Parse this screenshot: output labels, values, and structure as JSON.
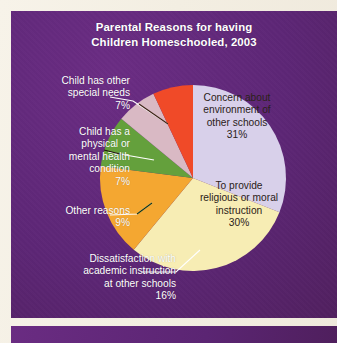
{
  "figure": {
    "title_line1": "Parental Reasons for having",
    "title_line2": "Children  Homeschooled, 2003",
    "panel_color": "#5d2676",
    "page_color": "#f6f2e7",
    "text_color": "#ffffff"
  },
  "chart_data": {
    "type": "pie",
    "title": "Parental Reasons for having Children Homeschooled, 2003",
    "xlabel": "",
    "ylabel": "",
    "legend_position": "callout-labels",
    "units": "percent",
    "categories": [
      "Concern about environment of other schools",
      "To provide religious or moral instruction",
      "Dissatisfaction with academic instruction at other schools",
      "Other reasons",
      "Child has a physical or mental health condition",
      "Child has other special needs"
    ],
    "values": [
      31,
      30,
      16,
      9,
      7,
      7
    ],
    "colors": [
      "#d8d0ea",
      "#f7edb4",
      "#f4a731",
      "#64a03c",
      "#d9b9c4",
      "#f04a28"
    ],
    "start_angle_deg": 0,
    "direction": "clockwise",
    "slices": [
      {
        "label_lines": [
          "Concern about",
          "environment of",
          "other schools"
        ],
        "value_label": "31%",
        "value": 31,
        "color": "#d8d0ea",
        "label_placement": "inside"
      },
      {
        "label_lines": [
          "To provide",
          "religious or moral",
          "instruction"
        ],
        "value_label": "30%",
        "value": 30,
        "color": "#f7edb4",
        "label_placement": "inside"
      },
      {
        "label_lines": [
          "Dissatisfaction with",
          "academic instruction",
          "at other schools"
        ],
        "value_label": "16%",
        "value": 16,
        "color": "#f4a731",
        "label_placement": "callout-left"
      },
      {
        "label_lines": [
          "Other reasons"
        ],
        "value_label": "9%",
        "value": 9,
        "color": "#64a03c",
        "label_placement": "callout-left"
      },
      {
        "label_lines": [
          "Child has a",
          "physical or",
          "mental health",
          "condition"
        ],
        "value_label": "7%",
        "value": 7,
        "color": "#d9b9c4",
        "label_placement": "callout-left"
      },
      {
        "label_lines": [
          "Child has other",
          "special needs"
        ],
        "value_label": "7%",
        "value": 7,
        "color": "#f04a28",
        "label_placement": "callout-left"
      }
    ]
  }
}
